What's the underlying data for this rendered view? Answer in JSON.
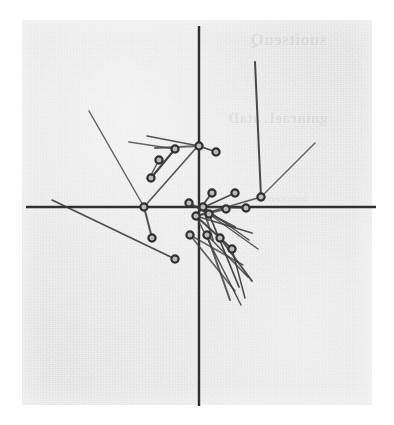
{
  "figure": {
    "title": "",
    "media": "scanned-page-halftone",
    "paper": {
      "x": 22,
      "y": 20,
      "width": 350,
      "height": 385,
      "color": "#ececec"
    },
    "ink_color": "#3b3b3b",
    "axis_color": "#2e2e2e",
    "node_fill": "#bdbdbd",
    "node_stroke": "#2f2f2f"
  },
  "bleed_through_text": {
    "line_1": "suoitseuQ",
    "line_2": "gninraeL ataD",
    "line_3": "noisnemid"
  },
  "chart_data": {
    "type": "scatter",
    "title": "",
    "subtitle": "",
    "xlabel": "",
    "ylabel": "",
    "grid": false,
    "legend": null,
    "axes": {
      "style": "crosshair-through-origin",
      "origin_px": [
        199,
        207
      ],
      "x_axis_px": {
        "x1": 26,
        "y1": 207,
        "x2": 376,
        "y2": 207
      },
      "y_axis_px": {
        "x1": 199,
        "y1": 26,
        "x2": 199,
        "y2": 406
      },
      "xlim": [
        -1.0,
        1.0
      ],
      "ylim": [
        -1.0,
        1.0
      ],
      "ticks": []
    },
    "note": "Each data point is an open circle marker with one or more straight line segments (vectors/loadings) radiating from it; coordinates are in source-image pixels.",
    "points": [
      {
        "id": "p01",
        "x_px": 175,
        "y_px": 149,
        "x": -0.14,
        "y": 0.3
      },
      {
        "id": "p02",
        "x_px": 199,
        "y_px": 146,
        "x": 0.0,
        "y": 0.32
      },
      {
        "id": "p03",
        "x_px": 216,
        "y_px": 152,
        "x": 0.1,
        "y": 0.29
      },
      {
        "id": "p04",
        "x_px": 159,
        "y_px": 160,
        "x": -0.23,
        "y": 0.25
      },
      {
        "id": "p05",
        "x_px": 151,
        "y_px": 178,
        "x": -0.27,
        "y": 0.15
      },
      {
        "id": "p06",
        "x_px": 144,
        "y_px": 207,
        "x": -0.31,
        "y": 0.0
      },
      {
        "id": "p07",
        "x_px": 152,
        "y_px": 238,
        "x": -0.27,
        "y": -0.16
      },
      {
        "id": "p08",
        "x_px": 175,
        "y_px": 259,
        "x": -0.14,
        "y": -0.27
      },
      {
        "id": "p09",
        "x_px": 261,
        "y_px": 197,
        "x": 0.35,
        "y": 0.05
      },
      {
        "id": "p10",
        "x_px": 246,
        "y_px": 208,
        "x": 0.27,
        "y": 0.0
      },
      {
        "id": "p11",
        "x_px": 212,
        "y_px": 193,
        "x": 0.07,
        "y": 0.07
      },
      {
        "id": "p12",
        "x_px": 235,
        "y_px": 193,
        "x": 0.21,
        "y": 0.07
      },
      {
        "id": "p13",
        "x_px": 189,
        "y_px": 203,
        "x": -0.06,
        "y": 0.02
      },
      {
        "id": "p14",
        "x_px": 203,
        "y_px": 207,
        "x": 0.02,
        "y": 0.0
      },
      {
        "id": "p15",
        "x_px": 226,
        "y_px": 209,
        "x": 0.15,
        "y": -0.01
      },
      {
        "id": "p16",
        "x_px": 209,
        "y_px": 214,
        "x": 0.06,
        "y": -0.04
      },
      {
        "id": "p17",
        "x_px": 196,
        "y_px": 216,
        "x": -0.02,
        "y": -0.05
      },
      {
        "id": "p18",
        "x_px": 190,
        "y_px": 235,
        "x": -0.05,
        "y": -0.15
      },
      {
        "id": "p19",
        "x_px": 207,
        "y_px": 235,
        "x": 0.05,
        "y": -0.15
      },
      {
        "id": "p20",
        "x_px": 220,
        "y_px": 238,
        "x": 0.12,
        "y": -0.16
      },
      {
        "id": "p21",
        "x_px": 232,
        "y_px": 249,
        "x": 0.19,
        "y": -0.22
      }
    ],
    "vectors": [
      {
        "from": "p06",
        "to_px": [
          89,
          111
        ]
      },
      {
        "from": "p06",
        "to_px": [
          197,
          147
        ]
      },
      {
        "from": "p06",
        "to_px": [
          152,
          238
        ]
      },
      {
        "from": "p08",
        "to_px": [
          52,
          200
        ]
      },
      {
        "from": "p01",
        "to_px": [
          129,
          142
        ]
      },
      {
        "from": "p01",
        "to_px": [
          151,
          178
        ]
      },
      {
        "from": "p02",
        "to_px": [
          147,
          136
        ]
      },
      {
        "from": "p02",
        "to_px": [
          216,
          152
        ]
      },
      {
        "from": "p02",
        "to_px": [
          155,
          148
        ]
      },
      {
        "from": "p04",
        "to_px": [
          150,
          177
        ]
      },
      {
        "from": "p05",
        "to_px": [
          175,
          149
        ]
      },
      {
        "from": "p09",
        "to_px": [
          255,
          62
        ]
      },
      {
        "from": "p09",
        "to_px": [
          315,
          143
        ]
      },
      {
        "from": "p09",
        "to_px": [
          196,
          216
        ]
      },
      {
        "from": "p11",
        "to_px": [
          199,
          210
        ]
      },
      {
        "from": "p12",
        "to_px": [
          202,
          208
        ]
      },
      {
        "from": "p10",
        "to_px": [
          203,
          207
        ]
      },
      {
        "from": "p13",
        "to_px": [
          235,
          227
        ]
      },
      {
        "from": "p14",
        "to_px": [
          249,
          240
        ]
      },
      {
        "from": "p14",
        "to_px": [
          196,
          216
        ]
      },
      {
        "from": "p15",
        "to_px": [
          196,
          216
        ]
      },
      {
        "from": "p16",
        "to_px": [
          258,
          249
        ]
      },
      {
        "from": "p17",
        "to_px": [
          252,
          233
        ]
      },
      {
        "from": "p17",
        "to_px": [
          232,
          249
        ]
      },
      {
        "from": "p18",
        "to_px": [
          243,
          265
        ]
      },
      {
        "from": "p19",
        "to_px": [
          248,
          277
        ]
      },
      {
        "from": "p20",
        "to_px": [
          252,
          281
        ]
      },
      {
        "from": "p21",
        "to_px": [
          245,
          298
        ]
      },
      {
        "from": "p18",
        "to_px": [
          235,
          291
        ]
      },
      {
        "from": "p19",
        "to_px": [
          230,
          300
        ]
      },
      {
        "from": "p17",
        "to_px": [
          241,
          305
        ]
      },
      {
        "from": "p16",
        "to_px": [
          239,
          287
        ]
      },
      {
        "from": "p14",
        "to_px": [
          213,
          240
        ]
      }
    ]
  }
}
